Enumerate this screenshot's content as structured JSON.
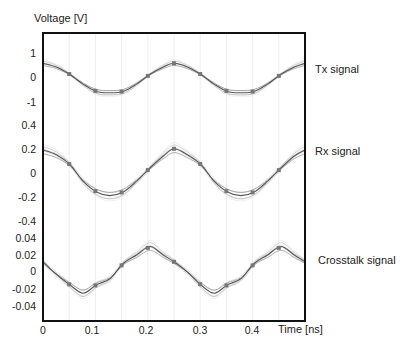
{
  "chart_data": {
    "type": "line",
    "title": "",
    "ylabel": "Voltage [V]",
    "xlabel": "Time [ns]",
    "x_ticks": [
      "0",
      "0.1",
      "0.2",
      "0.3",
      "0.4"
    ],
    "xlim": [
      0,
      0.49
    ],
    "grid": "faint vertical lines",
    "panels": [
      {
        "name": "Tx signal",
        "y_ticks": [
          "1",
          "0",
          "-1"
        ],
        "ylim": [
          -1.5,
          1.8
        ],
        "x": [
          0,
          0.025,
          0.05,
          0.075,
          0.1,
          0.125,
          0.15,
          0.175,
          0.2,
          0.225,
          0.245,
          0.27,
          0.295,
          0.32,
          0.345,
          0.37,
          0.395,
          0.42,
          0.445,
          0.47,
          0.49
        ],
        "series": [
          {
            "name": "Tx signal",
            "values": [
              0.6,
              0.45,
              0.15,
              -0.25,
              -0.55,
              -0.6,
              -0.55,
              -0.25,
              0.15,
              0.45,
              0.6,
              0.45,
              0.15,
              -0.25,
              -0.55,
              -0.6,
              -0.55,
              -0.25,
              0.15,
              0.45,
              0.6
            ]
          }
        ]
      },
      {
        "name": "Rx signal",
        "y_ticks": [
          "0.4",
          "0.2",
          "0",
          "-0.2",
          "-0.4"
        ],
        "ylim": [
          -0.42,
          0.42
        ],
        "x": [
          0,
          0.025,
          0.05,
          0.075,
          0.1,
          0.125,
          0.15,
          0.175,
          0.2,
          0.225,
          0.245,
          0.27,
          0.295,
          0.32,
          0.345,
          0.37,
          0.395,
          0.42,
          0.445,
          0.47,
          0.49
        ],
        "series": [
          {
            "name": "Rx signal",
            "values": [
              0.2,
              0.16,
              0.08,
              -0.06,
              -0.15,
              -0.18,
              -0.15,
              -0.06,
              0.05,
              0.15,
              0.21,
              0.16,
              0.08,
              -0.06,
              -0.15,
              -0.18,
              -0.15,
              -0.06,
              0.05,
              0.15,
              0.2
            ]
          }
        ]
      },
      {
        "name": "Crosstalk signal",
        "y_ticks": [
          "0.04",
          "0.02",
          "0",
          "-0.02",
          "-0.04"
        ],
        "ylim": [
          -0.054,
          0.054
        ],
        "x": [
          0,
          0.02,
          0.05,
          0.075,
          0.1,
          0.125,
          0.15,
          0.175,
          0.2,
          0.225,
          0.245,
          0.27,
          0.295,
          0.32,
          0.345,
          0.37,
          0.395,
          0.42,
          0.445,
          0.47,
          0.49
        ],
        "series": [
          {
            "name": "Crosstalk signal",
            "values": [
              0.012,
              0.0,
              -0.015,
              -0.025,
              -0.015,
              -0.008,
              0.01,
              0.02,
              0.03,
              0.02,
              0.012,
              0.0,
              -0.015,
              -0.025,
              -0.015,
              -0.008,
              0.01,
              0.02,
              0.03,
              0.02,
              0.012
            ]
          }
        ]
      }
    ]
  },
  "labels": {
    "ylabel": "Voltage [V]",
    "xlabel": "Time [ns]",
    "tx": "Tx signal",
    "rx": "Rx signal",
    "xt": "Crosstalk signal"
  }
}
